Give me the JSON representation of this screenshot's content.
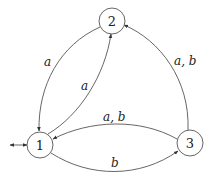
{
  "diagram": {
    "type": "finite-automaton",
    "states": [
      {
        "id": "1",
        "label": "1",
        "initial": true,
        "final": true
      },
      {
        "id": "2",
        "label": "2"
      },
      {
        "id": "3",
        "label": "3"
      }
    ],
    "edges": [
      {
        "from": "2",
        "to": "1",
        "label": "a"
      },
      {
        "from": "1",
        "to": "2",
        "label": "a"
      },
      {
        "from": "3",
        "to": "2",
        "label": "a, b"
      },
      {
        "from": "3",
        "to": "1",
        "label": "a, b"
      },
      {
        "from": "1",
        "to": "3",
        "label": "b"
      }
    ],
    "colors": {
      "stroke": "#555555",
      "text": "#222222",
      "background": "#ffffff"
    }
  }
}
